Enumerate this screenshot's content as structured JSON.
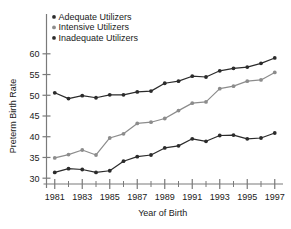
{
  "chart_data": {
    "type": "line",
    "title": "",
    "xlabel": "Year of Birth",
    "ylabel": "Preterm Birth Rate",
    "xlim": [
      1980.4,
      1997.6
    ],
    "ylim": [
      28.6,
      61.4
    ],
    "grid": false,
    "legend_position": "top-left-inside",
    "x": [
      1981,
      1982,
      1983,
      1984,
      1985,
      1986,
      1987,
      1988,
      1989,
      1990,
      1991,
      1992,
      1993,
      1994,
      1995,
      1996,
      1997
    ],
    "xticks": [
      1981,
      1983,
      1985,
      1987,
      1989,
      1991,
      1993,
      1995,
      1997
    ],
    "xtick_labels": [
      "1981",
      "1983",
      "1985",
      "1987",
      "1989",
      "1991",
      "1993",
      "1995",
      "1997"
    ],
    "xticks_minor": [
      1982,
      1984,
      1986,
      1988,
      1990,
      1992,
      1994,
      1996
    ],
    "yticks": [
      30,
      35,
      40,
      45,
      50,
      55,
      60
    ],
    "ytick_labels": [
      "30",
      "35",
      "40",
      "45",
      "50",
      "55",
      "60"
    ],
    "series": [
      {
        "name": "Inadequate Utilizers",
        "color": "#2b2b2b",
        "marker": "circle",
        "values": [
          50.6,
          49.2,
          49.9,
          49.4,
          50.1,
          50.1,
          50.8,
          51.0,
          52.9,
          53.4,
          54.6,
          54.4,
          55.9,
          56.5,
          56.8,
          57.7,
          59.0
        ]
      },
      {
        "name": "Intensive Utilizers",
        "color": "#8c8c8c",
        "marker": "circle",
        "values": [
          34.9,
          35.7,
          36.8,
          35.6,
          39.7,
          40.7,
          43.2,
          43.5,
          44.4,
          46.3,
          48.1,
          48.4,
          51.6,
          52.2,
          53.4,
          53.7,
          55.5
        ]
      },
      {
        "name": "Adequate Utilizers",
        "color": "#2b2b2b",
        "marker": "circle",
        "values": [
          31.4,
          32.3,
          32.1,
          31.4,
          31.8,
          34.1,
          35.2,
          35.6,
          37.3,
          37.8,
          39.5,
          38.9,
          40.3,
          40.4,
          39.5,
          39.7,
          40.9
        ]
      }
    ],
    "legend": [
      {
        "label": "Adequate Utilizers",
        "color": "#2b2b2b"
      },
      {
        "label": "Intensive Utilizers",
        "color": "#8c8c8c"
      },
      {
        "label": "Inadequate Utilizers",
        "color": "#2b2b2b"
      }
    ],
    "axis_color": "#7a7a7a",
    "background": "#ffffff"
  }
}
